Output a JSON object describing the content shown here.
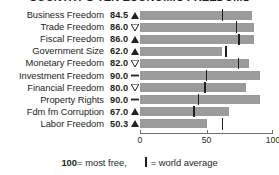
{
  "chart_data": {
    "type": "bar",
    "title": "COUNTRY'S TEN ECONOMIC FREEDOMS",
    "orientation": "horizontal",
    "categories": [
      "Business Freedom",
      "Trade Freedom",
      "Fiscal Freedom",
      "Government Size",
      "Monetary Freedom",
      "Investment Freedom",
      "Financial Freedom",
      "Property Rights",
      "Fdm fm Corruption",
      "Labor Freedom"
    ],
    "values": [
      84.5,
      86.0,
      86.0,
      62.0,
      82.0,
      90.0,
      80.0,
      90.0,
      67.0,
      50.3
    ],
    "value_labels": [
      "84.5",
      "86.0",
      "86.0",
      "62.0",
      "82.0",
      "90.0",
      "80.0",
      "90.0",
      "67.0",
      "50.3"
    ],
    "trend_markers": [
      "up",
      "down",
      "up",
      "up",
      "down",
      "flat",
      "down",
      "flat",
      "up",
      "up"
    ],
    "world_average": [
      62.0,
      72.5,
      74.5,
      64.5,
      74.0,
      50.0,
      49.0,
      44.0,
      40.5,
      62.0
    ],
    "xlabel": "",
    "ylabel": "",
    "xlim": [
      0,
      100
    ],
    "xticks": [
      0,
      50,
      100
    ],
    "xtick_labels": [
      "0",
      "50",
      "100"
    ],
    "grid": false,
    "legend_position": "bottom",
    "bar_color": "#9b9b9b",
    "marker_color": "#231f20",
    "axis_color": "#6d6e70"
  },
  "legend": {
    "scale_note_value": "100",
    "scale_note_text": " = most free,",
    "average_text": "= world average"
  }
}
